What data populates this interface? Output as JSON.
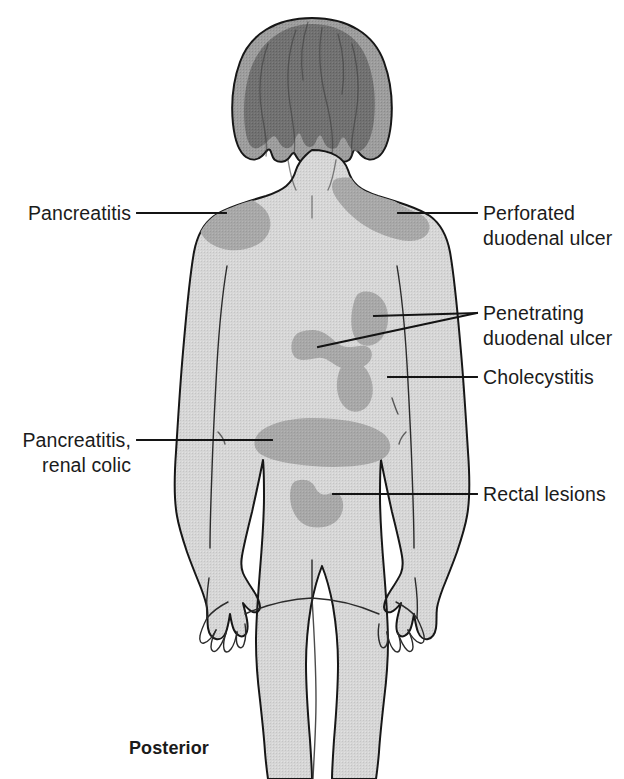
{
  "figure": {
    "orientation_label": "Posterior",
    "colors": {
      "background": "#ffffff",
      "skin": "#d6d6d6",
      "pain_patch": "#a8a8a8",
      "hair_base": "#9a9a9a",
      "hair_shadow": "#6d6d6d",
      "outline": "#171717",
      "text": "#1b1b1b"
    }
  },
  "labels": {
    "left": [
      {
        "id": "pancreatitis",
        "lines": [
          "Pancreatitis"
        ],
        "text_anchor": "end",
        "text_x": 131,
        "text_y": 220,
        "leader": "M137,213 L226,213"
      },
      {
        "id": "pancreatitis-renal-colic",
        "lines": [
          "Pancreatitis,",
          "renal colic"
        ],
        "text_anchor": "end",
        "text_x": 131,
        "text_y": 447,
        "leader": "M137,440 L272,440"
      }
    ],
    "right": [
      {
        "id": "perforated-duodenal-ulcer",
        "lines": [
          "Perforated",
          "duodenal ulcer"
        ],
        "text_anchor": "start",
        "text_x": 483,
        "text_y": 218,
        "leader": "M398,213 L477,213"
      },
      {
        "id": "penetrating-duodenal-ulcer",
        "lines": [
          "Penetrating",
          "duodenal ulcer"
        ],
        "text_anchor": "start",
        "text_x": 483,
        "text_y": 319,
        "leader_primary": "M374,316 L477,313",
        "leader_secondary": "M318,347 L477,313"
      },
      {
        "id": "cholecystitis",
        "lines": [
          "Cholecystitis"
        ],
        "text_anchor": "start",
        "text_x": 483,
        "text_y": 384,
        "leader": "M388,377 L477,377"
      },
      {
        "id": "rectal-lesions",
        "lines": [
          "Rectal lesions"
        ],
        "text_anchor": "start",
        "text_x": 483,
        "text_y": 501,
        "leader": "M333,494 L477,494"
      }
    ]
  },
  "pain_regions": [
    {
      "id": "left-shoulder-patch",
      "name": "Pancreatitis shoulder patch"
    },
    {
      "id": "right-shoulder-patch",
      "name": "Perforated duodenal ulcer shoulder patch"
    },
    {
      "id": "mid-left-patch",
      "name": "Penetrating duodenal ulcer left patch"
    },
    {
      "id": "mid-upper-right-patch",
      "name": "Penetrating duodenal ulcer right patch"
    },
    {
      "id": "mid-lower-right-patch",
      "name": "Cholecystitis patch"
    },
    {
      "id": "lumbar-band-patch",
      "name": "Pancreatitis renal colic lumbar band"
    },
    {
      "id": "sacral-patch",
      "name": "Rectal lesions sacral patch"
    }
  ]
}
